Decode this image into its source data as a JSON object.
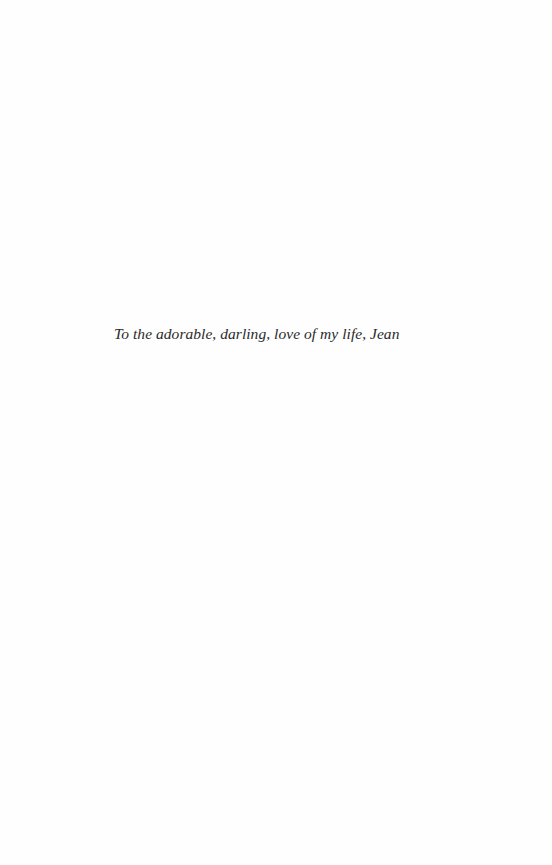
{
  "page": {
    "dedication": "To the adorable, darling, love of my life, Jean"
  }
}
